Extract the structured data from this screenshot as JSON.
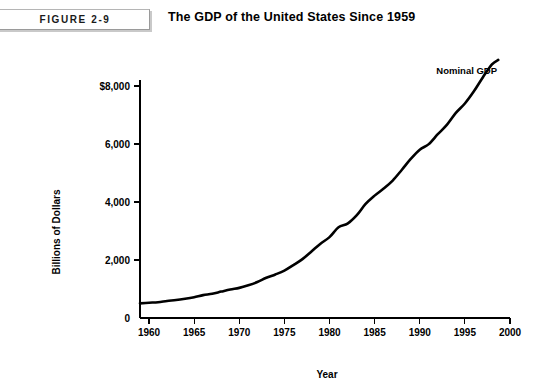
{
  "figure": {
    "badge_label": "FIGURE 2-9",
    "title": "The GDP of the United States Since 1959"
  },
  "chart_data": {
    "type": "line",
    "title": "The GDP of the United States Since 1959",
    "xlabel": "Year",
    "ylabel": "Billions of Dollars",
    "xlim": [
      1959,
      2000
    ],
    "ylim": [
      0,
      8800
    ],
    "grid": false,
    "legend_position": "inline-annotation",
    "line_color": "#000000",
    "line_width": 2.6,
    "xticks": [
      1960,
      1965,
      1970,
      1975,
      1980,
      1985,
      1990,
      1995,
      2000
    ],
    "xtick_labels": [
      "1960",
      "1965",
      "1970",
      "1975",
      "1980",
      "1985",
      "1990",
      "1995",
      "2000"
    ],
    "yticks": [
      0,
      2000,
      4000,
      6000,
      8000
    ],
    "ytick_labels": [
      "0",
      "2,000",
      "4,000",
      "6,000",
      "$8,000"
    ],
    "annotations": [
      {
        "text": "Nominal GDP",
        "x": 1995.2,
        "y": 8430
      }
    ],
    "series": [
      {
        "name": "Nominal GDP",
        "x": [
          1959,
          1960,
          1961,
          1962,
          1963,
          1964,
          1965,
          1966,
          1967,
          1968,
          1969,
          1970,
          1971,
          1972,
          1973,
          1974,
          1975,
          1976,
          1977,
          1978,
          1979,
          1980,
          1981,
          1982,
          1983,
          1984,
          1985,
          1986,
          1987,
          1988,
          1989,
          1990,
          1991,
          1992,
          1993,
          1994,
          1995,
          1996,
          1997,
          1998,
          1998.7
        ],
        "values": [
          506,
          527,
          545,
          586,
          618,
          664,
          719,
          788,
          833,
          910,
          985,
          1039,
          1128,
          1240,
          1386,
          1501,
          1635,
          1824,
          2031,
          2295,
          2563,
          2790,
          3128,
          3255,
          3537,
          3933,
          4220,
          4463,
          4740,
          5104,
          5484,
          5803,
          5996,
          6338,
          6657,
          7072,
          7398,
          7817,
          8304,
          8747,
          8900
        ]
      }
    ]
  }
}
